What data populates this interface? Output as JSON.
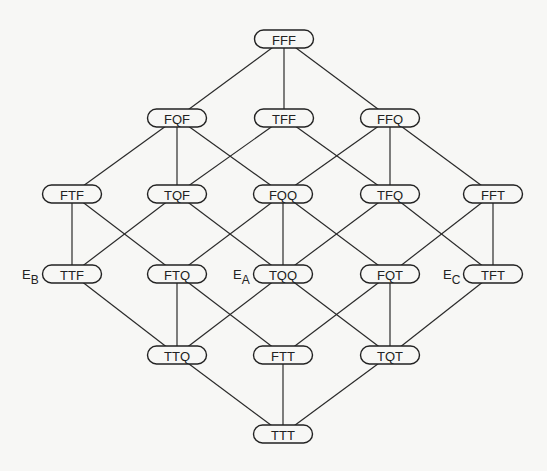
{
  "diagram": {
    "type": "lattice",
    "node_size": {
      "width": 59,
      "height": 18
    },
    "colors": {
      "background": "#f7f7f5",
      "stroke": "#222222",
      "text": "#222222"
    },
    "nodes": [
      {
        "id": "FFF",
        "label": "FFF",
        "x": 284,
        "y": 39
      },
      {
        "id": "FQF",
        "label": "FQF",
        "x": 177,
        "y": 118
      },
      {
        "id": "TFF",
        "label": "TFF",
        "x": 284,
        "y": 118
      },
      {
        "id": "FFQ",
        "label": "FFQ",
        "x": 390,
        "y": 118
      },
      {
        "id": "FTF",
        "label": "FTF",
        "x": 72,
        "y": 194
      },
      {
        "id": "TQF",
        "label": "TQF",
        "x": 177,
        "y": 194
      },
      {
        "id": "FQQ",
        "label": "FQQ",
        "x": 283,
        "y": 194
      },
      {
        "id": "TFQ",
        "label": "TFQ",
        "x": 390,
        "y": 194
      },
      {
        "id": "FFT",
        "label": "FFT",
        "x": 493,
        "y": 194
      },
      {
        "id": "TTF",
        "label": "TTF",
        "x": 72,
        "y": 274
      },
      {
        "id": "FTQ",
        "label": "FTQ",
        "x": 177,
        "y": 274
      },
      {
        "id": "TQQ",
        "label": "TQQ",
        "x": 283,
        "y": 274
      },
      {
        "id": "FQT",
        "label": "FQT",
        "x": 390,
        "y": 274
      },
      {
        "id": "TFT",
        "label": "TFT",
        "x": 493,
        "y": 274
      },
      {
        "id": "TTQ",
        "label": "TTQ",
        "x": 177,
        "y": 355
      },
      {
        "id": "FTT",
        "label": "FTT",
        "x": 283,
        "y": 355
      },
      {
        "id": "TQT",
        "label": "TQT",
        "x": 390,
        "y": 355
      },
      {
        "id": "TTT",
        "label": "TTT",
        "x": 283,
        "y": 434
      }
    ],
    "edges": [
      [
        "FFF",
        "FQF"
      ],
      [
        "FFF",
        "TFF"
      ],
      [
        "FFF",
        "FFQ"
      ],
      [
        "FQF",
        "FTF"
      ],
      [
        "FQF",
        "TQF"
      ],
      [
        "FQF",
        "FQQ"
      ],
      [
        "TFF",
        "TQF"
      ],
      [
        "TFF",
        "TFQ"
      ],
      [
        "FFQ",
        "FQQ"
      ],
      [
        "FFQ",
        "TFQ"
      ],
      [
        "FFQ",
        "FFT"
      ],
      [
        "FTF",
        "TTF"
      ],
      [
        "FTF",
        "FTQ"
      ],
      [
        "TQF",
        "TTF"
      ],
      [
        "TQF",
        "TQQ"
      ],
      [
        "FQQ",
        "FTQ"
      ],
      [
        "FQQ",
        "TQQ"
      ],
      [
        "FQQ",
        "FQT"
      ],
      [
        "TFQ",
        "TQQ"
      ],
      [
        "TFQ",
        "TFT"
      ],
      [
        "FFT",
        "FQT"
      ],
      [
        "FFT",
        "TFT"
      ],
      [
        "TTF",
        "TTQ"
      ],
      [
        "FTQ",
        "TTQ"
      ],
      [
        "FTQ",
        "FTT"
      ],
      [
        "TQQ",
        "TTQ"
      ],
      [
        "TQQ",
        "TQT"
      ],
      [
        "FQT",
        "FTT"
      ],
      [
        "FQT",
        "TQT"
      ],
      [
        "TFT",
        "TQT"
      ],
      [
        "TTQ",
        "TTT"
      ],
      [
        "FTT",
        "TTT"
      ],
      [
        "TQT",
        "TTT"
      ]
    ],
    "annotations": [
      {
        "id": "EB",
        "main": "E",
        "sub": "B",
        "node": "TTF",
        "x": 22,
        "y": 279
      },
      {
        "id": "EA",
        "main": "E",
        "sub": "A",
        "node": "TQQ",
        "x": 233,
        "y": 279
      },
      {
        "id": "EC",
        "main": "E",
        "sub": "C",
        "node": "TFT",
        "x": 443,
        "y": 279
      }
    ]
  }
}
